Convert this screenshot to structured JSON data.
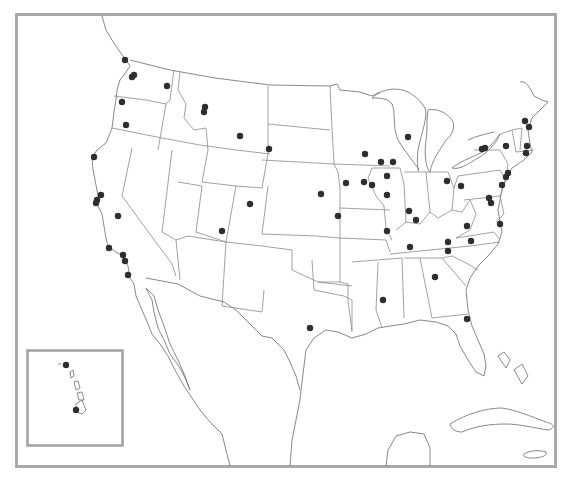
{
  "map": {
    "type": "point-map",
    "region": "Contiguous United States with Hawaii inset",
    "frame_color": "#a9a9a9",
    "marker_color": "#2e2e2e",
    "marker_radius": 3.2,
    "inset": {
      "label": "Hawaii",
      "x": 27,
      "y": 350,
      "width": 95,
      "height": 95
    },
    "points": [
      {
        "x": 125,
        "y": 60
      },
      {
        "x": 132,
        "y": 77
      },
      {
        "x": 134,
        "y": 75
      },
      {
        "x": 167,
        "y": 86
      },
      {
        "x": 122,
        "y": 102
      },
      {
        "x": 126,
        "y": 125
      },
      {
        "x": 205,
        "y": 107
      },
      {
        "x": 204,
        "y": 112
      },
      {
        "x": 240,
        "y": 136
      },
      {
        "x": 269,
        "y": 149
      },
      {
        "x": 94,
        "y": 157
      },
      {
        "x": 101,
        "y": 195
      },
      {
        "x": 97,
        "y": 200
      },
      {
        "x": 96,
        "y": 203
      },
      {
        "x": 118,
        "y": 216
      },
      {
        "x": 109,
        "y": 248
      },
      {
        "x": 123,
        "y": 255
      },
      {
        "x": 125,
        "y": 261
      },
      {
        "x": 128,
        "y": 275
      },
      {
        "x": 250,
        "y": 204
      },
      {
        "x": 222,
        "y": 231
      },
      {
        "x": 321,
        "y": 194
      },
      {
        "x": 338,
        "y": 216
      },
      {
        "x": 346,
        "y": 183
      },
      {
        "x": 364,
        "y": 182
      },
      {
        "x": 372,
        "y": 185
      },
      {
        "x": 365,
        "y": 154
      },
      {
        "x": 381,
        "y": 162
      },
      {
        "x": 393,
        "y": 162
      },
      {
        "x": 408,
        "y": 137
      },
      {
        "x": 387,
        "y": 176
      },
      {
        "x": 387,
        "y": 195
      },
      {
        "x": 387,
        "y": 231
      },
      {
        "x": 409,
        "y": 211
      },
      {
        "x": 416,
        "y": 220
      },
      {
        "x": 447,
        "y": 181
      },
      {
        "x": 461,
        "y": 186
      },
      {
        "x": 482,
        "y": 149
      },
      {
        "x": 485,
        "y": 148
      },
      {
        "x": 506,
        "y": 146
      },
      {
        "x": 525,
        "y": 121
      },
      {
        "x": 529,
        "y": 127
      },
      {
        "x": 527,
        "y": 146
      },
      {
        "x": 526,
        "y": 153
      },
      {
        "x": 508,
        "y": 173
      },
      {
        "x": 506,
        "y": 177
      },
      {
        "x": 502,
        "y": 185
      },
      {
        "x": 489,
        "y": 198
      },
      {
        "x": 491,
        "y": 203
      },
      {
        "x": 467,
        "y": 226
      },
      {
        "x": 500,
        "y": 224
      },
      {
        "x": 410,
        "y": 247
      },
      {
        "x": 448,
        "y": 242
      },
      {
        "x": 448,
        "y": 251
      },
      {
        "x": 471,
        "y": 241
      },
      {
        "x": 435,
        "y": 277
      },
      {
        "x": 383,
        "y": 300
      },
      {
        "x": 467,
        "y": 319
      },
      {
        "x": 310,
        "y": 328
      },
      {
        "x": 66,
        "y": 365
      },
      {
        "x": 76,
        "y": 410
      }
    ]
  }
}
